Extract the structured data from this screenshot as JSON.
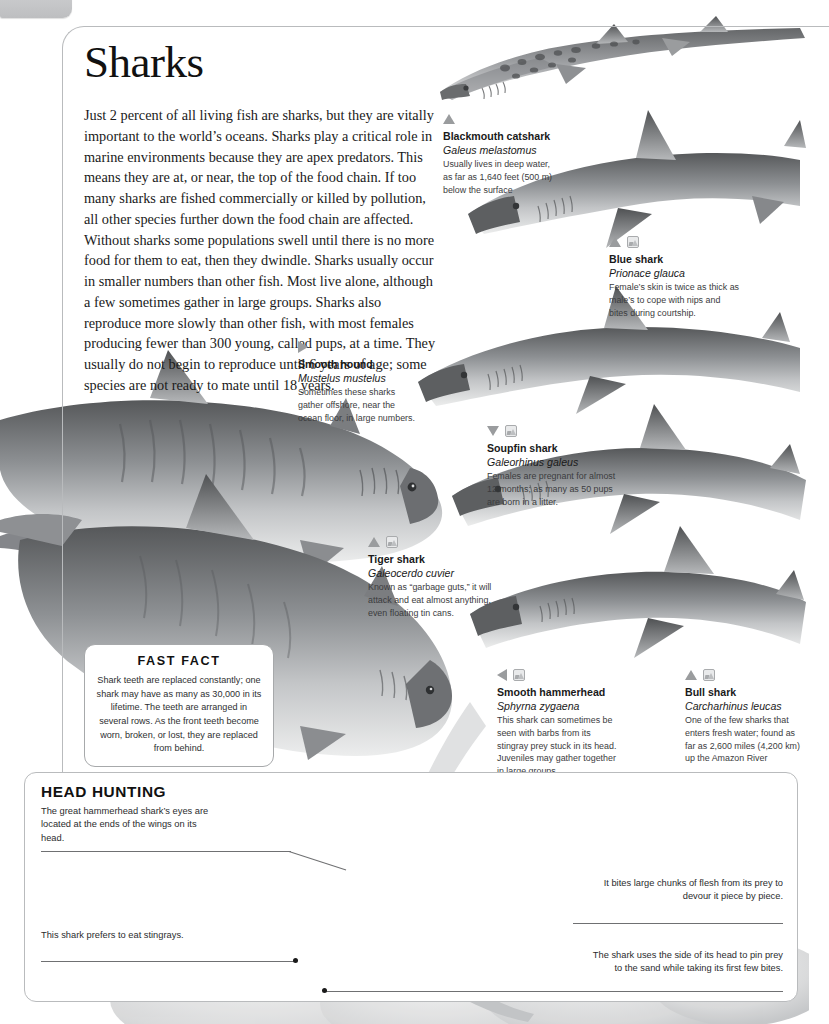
{
  "page": {
    "number": "166"
  },
  "article": {
    "title": "Sharks",
    "intro": "Just 2 percent of all living fish are sharks, but they are vitally important to the world’s oceans. Sharks play a critical role in marine environments because they are apex predators. This means they are at, or near, the top of the food chain. If too many sharks are fished commercially or killed by pollution, all other species further down the food chain are affected. Without sharks some populations swell until there is no more food for them to eat, then they dwindle. Sharks usually occur in smaller numbers than other fish. Most live alone, although a few sometimes gather in large groups. Sharks also reproduce more slowly than other fish, with most females producing fewer than 300 young, called pups, at a time. They usually do not begin to reproduce until 6 years of age; some species are not ready to mate until 18 years."
  },
  "species": [
    {
      "key": "blackmouth-catshark",
      "name": "Blackmouth catshark",
      "latin": "Galeus melastomus",
      "desc": "Usually lives in deep water, as far as 1,640 feet (500 m) below the surface",
      "marker": "up",
      "photo_icon": false
    },
    {
      "key": "blue-shark",
      "name": "Blue shark",
      "latin": "Prionace glauca",
      "desc": "Female’s skin is twice as thick as male’s to cope with nips and bites during courtship.",
      "marker": "up",
      "photo_icon": true
    },
    {
      "key": "smooth-hound",
      "name": "Smooth hound",
      "latin": "Mustelus mustelus",
      "desc": "Sometimes these sharks gather offshore, near the ocean floor, in large numbers.",
      "marker": "right",
      "photo_icon": false
    },
    {
      "key": "soupfin-shark",
      "name": "Soupfin shark",
      "latin": "Galeorhinus galeus",
      "desc": "Females are pregnant for almost 12 months; as many as 50 pups are born in a litter.",
      "marker": "down",
      "photo_icon": true
    },
    {
      "key": "tiger-shark",
      "name": "Tiger shark",
      "latin": "Galeocerdo cuvier",
      "desc": "Known as “garbage guts,” it will attack and eat almost anything, even floating tin cans.",
      "marker": "up",
      "photo_icon": true
    },
    {
      "key": "smooth-hammerhead",
      "name": "Smooth hammerhead",
      "latin": "Sphyrna zygaena",
      "desc": "This shark can sometimes be seen with barbs from its stingray prey stuck in its head. Juveniles may gather together in large groups.",
      "marker": "left",
      "photo_icon": true
    },
    {
      "key": "bull-shark",
      "name": "Bull shark",
      "latin": "Carcharhinus leucas",
      "desc": "One of the few sharks that enters fresh water; found as far as 2,600 miles (4,200 km) up the Amazon River",
      "marker": "up",
      "photo_icon": true
    }
  ],
  "fast_fact": {
    "heading": "FAST FACT",
    "body": "Shark teeth are replaced constantly; one shark may have as many as 30,000 in its lifetime. The teeth are arranged in several rows. As the front teeth become worn, broken, or lost, they are replaced from behind."
  },
  "head_hunting": {
    "title": "HEAD HUNTING",
    "notes": [
      {
        "key": "eyes-note",
        "text": "The great hammerhead shark’s eyes are located at the ends of the wings on its head."
      },
      {
        "key": "stingray-note",
        "text": "This shark prefers to eat stingrays."
      },
      {
        "key": "bite-note",
        "text": "It bites large chunks of flesh from its prey to devour it piece by piece."
      },
      {
        "key": "pin-note",
        "text": "The shark uses the side of its head to pin prey to the sand while taking its first few bites."
      }
    ]
  },
  "colors": {
    "ink": "#231f20",
    "rule": "#b9bbbd",
    "marker": "#9a9c9e",
    "art_dark": "#4e5052",
    "art_mid": "#9b9da0",
    "art_light": "#d9dadc"
  }
}
